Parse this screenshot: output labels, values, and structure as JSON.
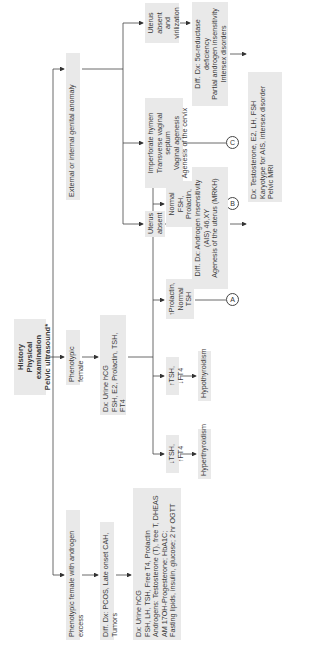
{
  "root": {
    "lines": "History\nPhysical examination\nPelvic ultrasound*"
  },
  "level1": {
    "androgen_excess": "Phenotypic female with androgen excess",
    "phenotypic_female": "Phenotypic female",
    "genital_anomaly": "External or internal genital anomaly"
  },
  "androgen_branch": {
    "diff_dx": "Diff. Dx: PCOS, Late onset CAH, Tumors",
    "dx": "Dx: Urine hCG\nFSH, LH, TSH, Free T4, Prolactin\nAndrogens: Testosterone (T), free T, DHEAS\nAM 17OH-Progesterone; HbA1C;\nFasting lipids, insulin, glucose; 2 hr OGTT"
  },
  "female_branch": {
    "dx": "Dx: Urine hCG\nFSH, E2, Prolactin, TSH, FT4",
    "results": [
      {
        "label": "↓TSH, ↑FT4",
        "outcome": "Hyperthyroidism"
      },
      {
        "label": "↑TSH, ↓FT4",
        "outcome": "Hypothyroidism"
      },
      {
        "label": "↑Prolactin,\nNormal TSH",
        "connector": "A"
      },
      {
        "label": "Normal FSH,\nProlactin,\nTSH, FreeT4",
        "connector": "B"
      },
      {
        "label": "↑FSH",
        "connector": "C"
      }
    ]
  },
  "anomaly_branch": {
    "uterus_absent": "Uterus\nabsent",
    "imperforate": "Imperforate hymen\nTransverse vaginal septum\nVaginal agenesis\nAgenesis of the cervix",
    "uterus_absent_virilization": "Uterus\nabsent and\nvirilization",
    "diff_dx_ais": "Diff. Dx: Androgen insensitivity\n(AIS) 46,XY\nAgenesis of the uterus (MRKH)",
    "diff_dx_5ar": "Diff. Dx: 5α-reductase deficiency\nPartial androgen insensitivity\nIntersex disorders",
    "dx_tests": "Dx: Testosterone, E2, LH, FSH\nKaryotype for AIS, intersex disorder\nPelvic MRI"
  },
  "colors": {
    "box_fill": "#e9e9e9",
    "line": "#444444",
    "text": "#3a3a3a"
  }
}
